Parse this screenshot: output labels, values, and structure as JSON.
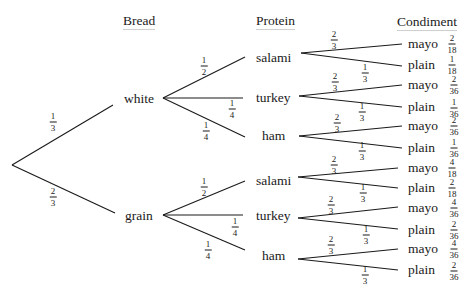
{
  "headers": {
    "bread": "Bread",
    "protein": "Protein",
    "condiment": "Condiment"
  },
  "bread": [
    {
      "label": "white",
      "prob": {
        "num": "1",
        "den": "3"
      }
    },
    {
      "label": "grain",
      "prob": {
        "num": "2",
        "den": "3"
      }
    }
  ],
  "protein": {
    "white": [
      {
        "label": "salami",
        "prob": {
          "num": "1",
          "den": "2"
        }
      },
      {
        "label": "turkey",
        "prob": {
          "num": "1",
          "den": "4"
        }
      },
      {
        "label": "ham",
        "prob": {
          "num": "1",
          "den": "4"
        }
      }
    ],
    "grain": [
      {
        "label": "salami",
        "prob": {
          "num": "1",
          "den": "2"
        }
      },
      {
        "label": "turkey",
        "prob": {
          "num": "1",
          "den": "4"
        }
      },
      {
        "label": "ham",
        "prob": {
          "num": "1",
          "den": "4"
        }
      }
    ]
  },
  "condiment": {
    "white": [
      [
        {
          "label": "mayo",
          "prob": {
            "num": "2",
            "den": "3"
          },
          "joint": {
            "num": "2",
            "den": "18"
          }
        },
        {
          "label": "plain",
          "prob": {
            "num": "1",
            "den": "3"
          },
          "joint": {
            "num": "1",
            "den": "18"
          }
        }
      ],
      [
        {
          "label": "mayo",
          "prob": {
            "num": "2",
            "den": "3"
          },
          "joint": {
            "num": "2",
            "den": "36"
          }
        },
        {
          "label": "plain",
          "prob": {
            "num": "1",
            "den": "3"
          },
          "joint": {
            "num": "1",
            "den": "36"
          }
        }
      ],
      [
        {
          "label": "mayo",
          "prob": {
            "num": "2",
            "den": "3"
          },
          "joint": {
            "num": "2",
            "den": "36"
          }
        },
        {
          "label": "plain",
          "prob": {
            "num": "1",
            "den": "3"
          },
          "joint": {
            "num": "1",
            "den": "36"
          }
        }
      ]
    ],
    "grain": [
      [
        {
          "label": "mayo",
          "prob": {
            "num": "2",
            "den": "3"
          },
          "joint": {
            "num": "4",
            "den": "18"
          }
        },
        {
          "label": "plain",
          "prob": {
            "num": "1",
            "den": "3"
          },
          "joint": {
            "num": "2",
            "den": "18"
          }
        }
      ],
      [
        {
          "label": "mayo",
          "prob": {
            "num": "2",
            "den": "3"
          },
          "joint": {
            "num": "4",
            "den": "36"
          }
        },
        {
          "label": "plain",
          "prob": {
            "num": "1",
            "den": "3"
          },
          "joint": {
            "num": "2",
            "den": "36"
          }
        }
      ],
      [
        {
          "label": "mayo",
          "prob": {
            "num": "2",
            "den": "3"
          },
          "joint": {
            "num": "4",
            "den": "36"
          }
        },
        {
          "label": "plain",
          "prob": {
            "num": "1",
            "den": "3"
          },
          "joint": {
            "num": "2",
            "den": "36"
          }
        }
      ]
    ]
  },
  "style": {
    "line_color": "#1a1a1a",
    "text_color": "#1a1a1a",
    "background": "#ffffff"
  }
}
